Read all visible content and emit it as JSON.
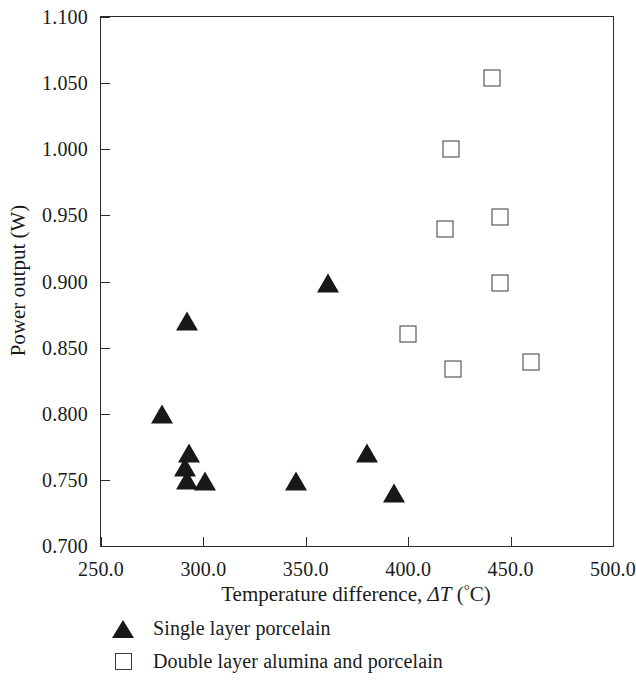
{
  "chart_data": {
    "type": "scatter",
    "title": "",
    "xlabel": "Temperature difference, ΔT (°C)",
    "ylabel": "Power output (W)",
    "xlim": [
      250.0,
      500.0
    ],
    "ylim": [
      0.7,
      1.1
    ],
    "xticks": [
      250.0,
      300.0,
      350.0,
      400.0,
      450.0,
      500.0
    ],
    "yticks": [
      0.7,
      0.75,
      0.8,
      0.85,
      0.9,
      0.95,
      1.0,
      1.05,
      1.1
    ],
    "xtick_labels": [
      "250.0",
      "300.0",
      "350.0",
      "400.0",
      "450.0",
      "500.0"
    ],
    "ytick_labels": [
      "0.700",
      "0.750",
      "0.800",
      "0.850",
      "0.900",
      "0.950",
      "1.000",
      "1.050",
      "1.100"
    ],
    "grid": false,
    "legend_position": "below-axes-left",
    "series": [
      {
        "name": "Single layer porcelain",
        "marker": "filled-triangle",
        "color": "#181818",
        "points": [
          {
            "x": 280.0,
            "y": 0.8
          },
          {
            "x": 292.0,
            "y": 0.87
          },
          {
            "x": 293.0,
            "y": 0.77
          },
          {
            "x": 291.0,
            "y": 0.76
          },
          {
            "x": 292.0,
            "y": 0.75
          },
          {
            "x": 301.0,
            "y": 0.749
          },
          {
            "x": 345.0,
            "y": 0.749
          },
          {
            "x": 361.0,
            "y": 0.899
          },
          {
            "x": 380.0,
            "y": 0.77
          },
          {
            "x": 393.0,
            "y": 0.74
          }
        ]
      },
      {
        "name": "Double layer alumina and porcelain",
        "marker": "open-square",
        "color": "#3a3a3a",
        "points": [
          {
            "x": 400.0,
            "y": 0.86
          },
          {
            "x": 418.0,
            "y": 0.94
          },
          {
            "x": 421.0,
            "y": 1.0
          },
          {
            "x": 422.0,
            "y": 0.834
          },
          {
            "x": 441.0,
            "y": 1.054
          },
          {
            "x": 445.0,
            "y": 0.949
          },
          {
            "x": 445.0,
            "y": 0.899
          },
          {
            "x": 460.0,
            "y": 0.839
          }
        ]
      }
    ]
  },
  "legend": {
    "items": [
      {
        "label": "Single layer porcelain",
        "marker": "filled-triangle"
      },
      {
        "label": "Double layer alumina and porcelain",
        "marker": "open-square"
      }
    ]
  },
  "axis_title_parts": {
    "x_prefix": "Temperature difference, ",
    "x_delta_t": "ΔT",
    "x_units_open": " (",
    "x_degree": "°",
    "x_celsius": "C)",
    "y_full": "Power output (W)"
  }
}
